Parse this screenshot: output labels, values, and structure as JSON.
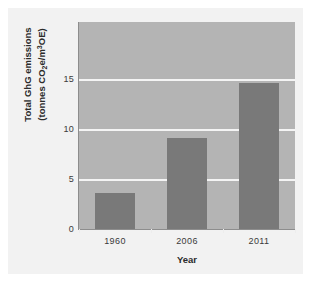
{
  "chart_data": {
    "type": "bar",
    "title": "",
    "categories": [
      "1960",
      "2006",
      "2011"
    ],
    "values": [
      3.7,
      9.2,
      14.7
    ],
    "series": [
      {
        "name": "Total GhG emissions",
        "values": [
          3.7,
          9.2,
          14.7
        ]
      }
    ],
    "xlabel": "Year",
    "ylabel_line1": "Total GhG emissions",
    "ylabel_line2_prefix": "(tonnes CO",
    "ylabel_line2_sub": "2",
    "ylabel_line2_mid": "e/m",
    "ylabel_line2_sup": "3",
    "ylabel_line2_suffix": "OE)",
    "ylabel_plain": "Total GhG emissions (tonnes CO2e/m3OE)",
    "ytick_labels": [
      "0",
      "5",
      "10",
      "15"
    ],
    "ytick_values": [
      0,
      5,
      10,
      15
    ],
    "ylim": [
      0,
      20.8
    ],
    "grid": true,
    "grid_color": "#f4f4f4",
    "legend": "none",
    "bar_color": "#797979",
    "plot_background": "#b4b4b4",
    "panel_background": "#f2f2f2",
    "page_background": "#ffffff",
    "axis_color": "#8d8d8d",
    "text_color": "#2b2b2b"
  }
}
